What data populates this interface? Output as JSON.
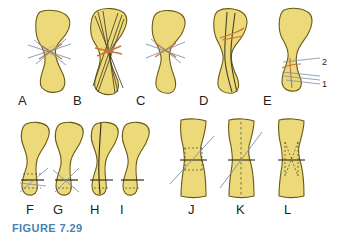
{
  "figure": {
    "caption": "FIGURE 7.29",
    "caption_color": "#4a7fb5",
    "background_color": "#ffffff",
    "bone_fill_color": "#ecd97a",
    "bone_outline_color": "#6b5a14",
    "fracture_line_color": "#c8743c",
    "wire_line_color": "#7d8da6",
    "label_color": "#231f20"
  },
  "panels": [
    {
      "id": "A",
      "label": "A",
      "label_x": 18,
      "label_y": 94,
      "description": "oblique fracture with crossed K-wires"
    },
    {
      "id": "B",
      "label": "B",
      "label_x": 73,
      "label_y": 94,
      "description": "multiple crossing long wires across fracture"
    },
    {
      "id": "C",
      "label": "C",
      "label_x": 136,
      "label_y": 94,
      "description": "narrow shaft with crossed pins at fracture"
    },
    {
      "id": "D",
      "label": "D",
      "label_x": 199,
      "label_y": 94,
      "description": "intramedullary longitudinal fixation"
    },
    {
      "id": "E",
      "label": "E",
      "label_x": 263,
      "label_y": 94,
      "description": "distal bone with two numbered wire placements"
    },
    {
      "id": "F",
      "label": "F",
      "label_x": 26,
      "label_y": 203,
      "description": "distal end transverse fixation view 1"
    },
    {
      "id": "G",
      "label": "G",
      "label_x": 53,
      "label_y": 203,
      "description": "distal end transverse fixation view 2"
    },
    {
      "id": "H",
      "label": "H",
      "label_x": 90,
      "label_y": 203,
      "description": "longitudinal central wire with transverse line"
    },
    {
      "id": "I",
      "label": "I",
      "label_x": 120,
      "label_y": 203,
      "description": "distal end transverse line only"
    },
    {
      "id": "J",
      "label": "J",
      "label_x": 188,
      "label_y": 203,
      "description": "shaft with oblique wire and transverse line"
    },
    {
      "id": "K",
      "label": "K",
      "label_x": 236,
      "label_y": 203,
      "description": "shaft with dotted axis, transverse and oblique wires"
    },
    {
      "id": "L",
      "label": "L",
      "label_x": 284,
      "label_y": 203,
      "description": "shaft with dotted crossing internal wires"
    }
  ],
  "callouts": [
    {
      "id": "2",
      "text": "2",
      "x": 322,
      "y": 63,
      "panel": "E"
    },
    {
      "id": "1",
      "text": "1",
      "x": 322,
      "y": 83,
      "panel": "E"
    }
  ]
}
